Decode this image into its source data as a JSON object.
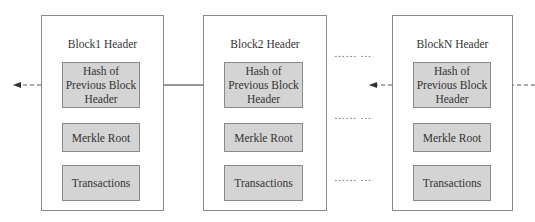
{
  "diagram": {
    "blocks": [
      {
        "title": "Block1 Header",
        "fields": [
          "Hash of Previous Block Header",
          "Merkle Root",
          "Transactions"
        ]
      },
      {
        "title": "Block2 Header",
        "fields": [
          "Hash of Previous Block Header",
          "Merkle Root",
          "Transactions"
        ]
      },
      {
        "title": "BlockN Header",
        "fields": [
          "Hash of Previous Block Header",
          "Merkle Root",
          "Transactions"
        ]
      }
    ],
    "ellipsis": "…… …",
    "ellipsis_rows": [
      "…… …",
      "…… …",
      "…… …"
    ],
    "colors": {
      "field_fill": "#d4d4d4",
      "border": "#8a8a8a",
      "arrow": "#333333"
    }
  }
}
